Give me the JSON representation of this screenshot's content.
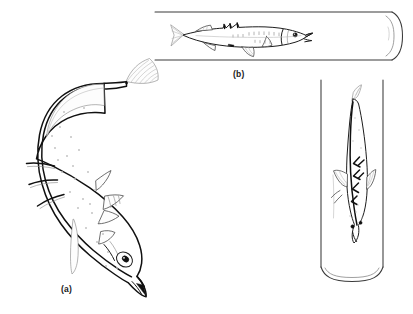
{
  "figure": {
    "kind": "scientific-line-drawing",
    "background_color": "#ffffff",
    "ink_color": "#101010",
    "width": 413,
    "height": 314,
    "panels": [
      {
        "id": "a",
        "label": "(a)",
        "caption_text": "(a)",
        "description": "free-swimming stickleback in curved S-shaped posture, lateral view, head down-right, three erect dorsal spines",
        "spine_count": 3,
        "orientation": "lateral",
        "in_tube": false
      },
      {
        "id": "b",
        "label": "(b)",
        "caption_text": "(b)",
        "description": "stickleback resting inside a horizontal glass tube, lateral view, head to the right",
        "spine_count": 3,
        "orientation": "lateral",
        "in_tube": true,
        "tube_orientation": "horizontal"
      },
      {
        "id": "c",
        "label": "",
        "caption_text": "",
        "description": "stickleback inside a vertical glass tube, dorsal view, head pointing downward",
        "orientation": "dorsal",
        "in_tube": true,
        "tube_orientation": "vertical"
      }
    ]
  },
  "labels": {
    "panel_a": "(a)",
    "panel_b": "(b)"
  },
  "colors": {
    "ink_heavy": "#101010",
    "ink": "#1d1d1d",
    "ink_mid": "#4a4a4a",
    "ink_light": "#8d8d8d",
    "tube": "#3a3a3a",
    "background": "#ffffff"
  }
}
